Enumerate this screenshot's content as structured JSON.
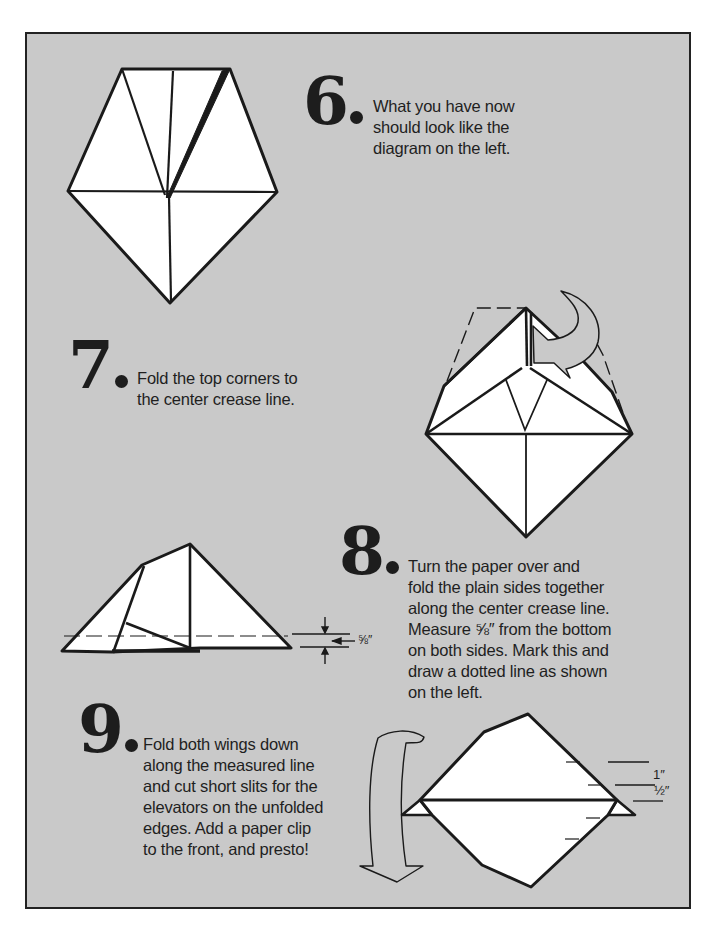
{
  "document": {
    "type": "origami paper airplane instructions",
    "background_color": "#c9c9c9",
    "border_color": "#222222"
  },
  "steps": [
    {
      "number": "6",
      "lines": [
        "What you have now",
        "should look like the",
        "diagram on the left."
      ]
    },
    {
      "number": "7",
      "lines": [
        "Fold the top corners to",
        "the center crease line."
      ]
    },
    {
      "number": "8",
      "lines": [
        "Turn the paper over and",
        "fold the plain sides together",
        "along the center crease line.",
        " Measure ⅝″ from the bottom",
        "on both sides.  Mark this and",
        "draw a dotted line  as shown",
        "on the left."
      ],
      "measurement_label": "⅝″"
    },
    {
      "number": "9",
      "lines": [
        "Fold both wings down",
        "along the measured line",
        "and cut short slits for the",
        "elevators on the unfolded",
        "edges.  Add a paper clip",
        "to the front, and presto!"
      ],
      "measurement_labels": [
        "1″",
        "½″"
      ]
    }
  ],
  "icons": {
    "step7_arrow": "curved-fold-arrow-icon",
    "step9_arrow": "curved-down-arrow-icon"
  }
}
